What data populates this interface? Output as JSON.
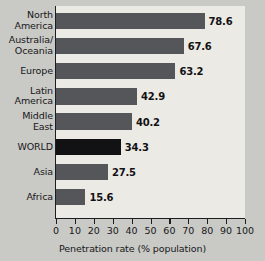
{
  "chart_data": {
    "type": "bar",
    "orientation": "horizontal",
    "title": "",
    "xlabel": "Penetration rate (% population)",
    "ylabel": "",
    "xlim": [
      0,
      100
    ],
    "xticks": [
      0,
      10,
      20,
      30,
      40,
      50,
      60,
      70,
      80,
      90,
      100
    ],
    "grid": false,
    "legend": null,
    "categories": [
      "North\nAmerica",
      "Australia/\nOceania",
      "Europe",
      "Latin\nAmerica",
      "Middle\nEast",
      "WORLD",
      "Asia",
      "Africa"
    ],
    "values": [
      78.6,
      67.6,
      63.2,
      42.9,
      40.2,
      34.3,
      27.5,
      15.6
    ],
    "value_labels": [
      "78.6",
      "67.6",
      "63.2",
      "42.9",
      "40.2",
      "34.3",
      "27.5",
      "15.6"
    ],
    "highlight_index": 5,
    "colors": {
      "bar": "#55565a",
      "bar_highlight": "#121214",
      "plot_background": "#eceae5",
      "page_background": "#c9c9c5",
      "axis": "#1d1d20",
      "text": "#17171a"
    }
  }
}
